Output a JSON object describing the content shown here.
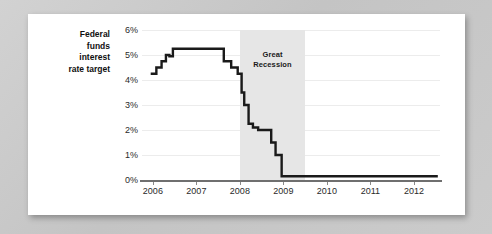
{
  "figure": {
    "series_label_lines": [
      "Federal",
      "funds",
      "interest",
      "rate target"
    ],
    "annotation": {
      "name": "great-recession-band",
      "label_lines": [
        "Great",
        "Recession"
      ],
      "start": 2008.0,
      "end": 2009.5,
      "fill": "#e6e6e6"
    },
    "colors": {
      "card_background": "#ffffff",
      "page_background": "#c9c9c9",
      "line": "#1a1a1a",
      "gridline": "#ececec",
      "axis": "#6f6f6f",
      "text": "#2a2a2a"
    }
  },
  "chart_data": {
    "type": "line",
    "title": "",
    "subtitle": "",
    "xlabel": "",
    "ylabel": "Federal funds interest rate target",
    "xlim": [
      2005.75,
      2012.6
    ],
    "ylim": [
      0,
      6
    ],
    "grid": true,
    "legend": "none",
    "x_ticks": [
      2006,
      2007,
      2008,
      2009,
      2010,
      2011,
      2012
    ],
    "x_tick_labels": [
      "2006",
      "2007",
      "2008",
      "2009",
      "2010",
      "2011",
      "2012"
    ],
    "y_ticks": [
      0,
      1,
      2,
      3,
      4,
      5,
      6
    ],
    "y_tick_labels": [
      "0%",
      "1%",
      "2%",
      "3%",
      "4%",
      "5%",
      "6%"
    ],
    "annotations": [
      {
        "text": "Great Recession",
        "type": "shaded-span",
        "x_start": 2008.0,
        "x_end": 2009.5
      }
    ],
    "series": [
      {
        "name": "Federal funds interest rate target",
        "color": "#1a1a1a",
        "step": true,
        "points": [
          [
            2005.95,
            4.25
          ],
          [
            2006.08,
            4.25
          ],
          [
            2006.08,
            4.5
          ],
          [
            2006.2,
            4.5
          ],
          [
            2006.2,
            4.75
          ],
          [
            2006.3,
            4.75
          ],
          [
            2006.3,
            5.0
          ],
          [
            2006.38,
            5.0
          ],
          [
            2006.38,
            4.95
          ],
          [
            2006.46,
            4.95
          ],
          [
            2006.46,
            5.25
          ],
          [
            2007.63,
            5.25
          ],
          [
            2007.63,
            4.75
          ],
          [
            2007.8,
            4.75
          ],
          [
            2007.8,
            4.5
          ],
          [
            2007.95,
            4.5
          ],
          [
            2007.95,
            4.25
          ],
          [
            2008.04,
            4.25
          ],
          [
            2008.04,
            3.5
          ],
          [
            2008.1,
            3.5
          ],
          [
            2008.1,
            3.0
          ],
          [
            2008.2,
            3.0
          ],
          [
            2008.2,
            2.25
          ],
          [
            2008.3,
            2.25
          ],
          [
            2008.3,
            2.1
          ],
          [
            2008.42,
            2.1
          ],
          [
            2008.42,
            2.0
          ],
          [
            2008.72,
            2.0
          ],
          [
            2008.72,
            1.5
          ],
          [
            2008.82,
            1.5
          ],
          [
            2008.82,
            1.0
          ],
          [
            2008.96,
            1.0
          ],
          [
            2008.96,
            0.15
          ],
          [
            2012.55,
            0.15
          ]
        ]
      }
    ]
  }
}
